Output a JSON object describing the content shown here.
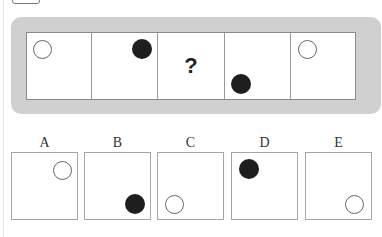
{
  "puzzle": {
    "sequence": [
      {
        "index": 1,
        "content": "circle",
        "style": "open",
        "position": "top-left",
        "cx": 16,
        "cy": 17
      },
      {
        "index": 2,
        "content": "circle",
        "style": "filled",
        "position": "top-right",
        "cx": 50,
        "cy": 16
      },
      {
        "index": 3,
        "content": "question",
        "label": "?"
      },
      {
        "index": 4,
        "content": "circle",
        "style": "filled",
        "position": "bottom-left",
        "cx": 16,
        "cy": 51
      },
      {
        "index": 5,
        "content": "circle",
        "style": "open",
        "position": "top-left",
        "cx": 16,
        "cy": 17
      }
    ],
    "options": [
      {
        "label": "A",
        "style": "open",
        "position": "top-right",
        "cx": 50,
        "cy": 17
      },
      {
        "label": "B",
        "style": "filled",
        "position": "bottom-right",
        "cx": 50,
        "cy": 51
      },
      {
        "label": "C",
        "style": "open",
        "position": "bottom-left",
        "cx": 17,
        "cy": 51
      },
      {
        "label": "D",
        "style": "filled",
        "position": "top-left",
        "cx": 17,
        "cy": 16
      },
      {
        "label": "E",
        "style": "open",
        "position": "bottom-right",
        "cx": 49,
        "cy": 51
      }
    ]
  },
  "colors": {
    "panel_bg": "#d0d0d0",
    "filled_dot": "#1e1e1e",
    "open_dot_border": "#666666"
  }
}
